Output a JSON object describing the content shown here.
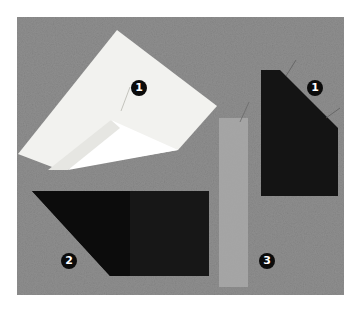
{
  "image": {
    "description": "Photo of three fabric/interfacing samples on a gray textured board with numbered callouts",
    "background_color": "#8f8f8f",
    "frame_color": "#ffffff"
  },
  "samples": [
    {
      "id": "white-interfacing",
      "color": "#f4f4f2",
      "fold_color": "#ffffff"
    },
    {
      "id": "dark-fabric-right",
      "color": "#131313"
    },
    {
      "id": "dark-fabric-bottom",
      "color": "#151515",
      "overlay_color": "#0c0c0c"
    },
    {
      "id": "translucent-strip",
      "color": "#a8a8a8"
    }
  ],
  "callouts": [
    {
      "label": "1",
      "x": 131,
      "y": 80
    },
    {
      "label": "1",
      "x": 307,
      "y": 80
    },
    {
      "label": "2",
      "x": 61,
      "y": 253
    },
    {
      "label": "3",
      "x": 259,
      "y": 253
    }
  ]
}
